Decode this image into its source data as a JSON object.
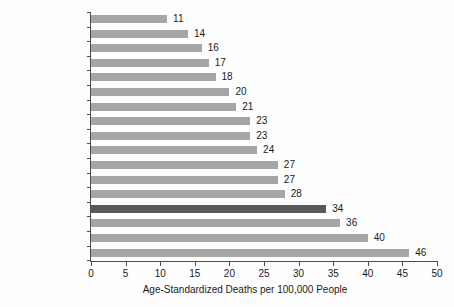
{
  "chart_data": {
    "type": "bar",
    "orientation": "horizontal",
    "title": "",
    "subtitle": "",
    "xlabel": "Age-Standardized Deaths per 100,000 People",
    "ylabel": "",
    "xlim": [
      0,
      50
    ],
    "xticks": [
      0,
      5,
      10,
      15,
      20,
      25,
      30,
      35,
      40,
      45,
      50
    ],
    "grid": false,
    "legend": null,
    "categories": [
      "Finland",
      "Austria",
      "Italy",
      "Switzerland",
      "Australia",
      "Sweden",
      "Germany",
      "France",
      "Canada",
      "Spain",
      "Norway",
      "Denmark",
      "Netherlands",
      "United States",
      "United Kingdom",
      "Japan",
      "Portugal"
    ],
    "values": [
      11,
      14,
      16,
      17,
      18,
      20,
      21,
      23,
      23,
      24,
      27,
      27,
      28,
      34,
      36,
      40,
      46
    ],
    "data_labels": [
      "11",
      "14",
      "16",
      "17",
      "18",
      "20",
      "21",
      "23",
      "23",
      "24",
      "27",
      "27",
      "28",
      "34",
      "36",
      "40",
      "46"
    ],
    "highlight_category": "United States",
    "colors": {
      "bar": "#a6a6a6",
      "bar_highlight": "#595959",
      "axis": "#4d4d4d",
      "text": "#1a1a1a",
      "background": "#fefefe"
    }
  }
}
